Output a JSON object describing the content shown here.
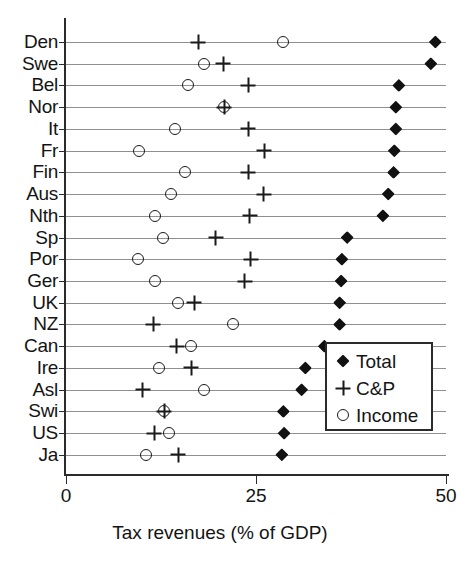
{
  "chart_data": {
    "type": "scatter",
    "title": "",
    "xlabel": "Tax revenues (% of GDP)",
    "ylabel": "",
    "xlim": [
      0,
      50
    ],
    "xticks": [
      0,
      25,
      50
    ],
    "xtick_labels": [
      "0",
      "25",
      "50"
    ],
    "grid": true,
    "legend_position": "lower-right",
    "categories": [
      "Den",
      "Swe",
      "Bel",
      "Nor",
      "It",
      "Fr",
      "Fin",
      "Aus",
      "Nth",
      "Sp",
      "Por",
      "Ger",
      "UK",
      "NZ",
      "Can",
      "Ire",
      "Asl",
      "Swi",
      "US",
      "Ja"
    ],
    "series": [
      {
        "name": "Total",
        "marker": "diamond",
        "values": [
          48.6,
          48.0,
          43.8,
          43.4,
          43.4,
          43.2,
          43.1,
          42.4,
          41.7,
          37.0,
          36.3,
          36.2,
          36.0,
          36.0,
          34.0,
          31.5,
          31.0,
          28.6,
          28.7,
          28.4
        ]
      },
      {
        "name": "C&P",
        "marker": "plus",
        "values": [
          17.4,
          20.7,
          24.0,
          20.8,
          24.0,
          26.1,
          24.0,
          26.0,
          24.2,
          19.7,
          24.3,
          23.5,
          16.9,
          11.5,
          14.6,
          16.5,
          10.1,
          12.9,
          11.6,
          14.8
        ]
      },
      {
        "name": "Income",
        "marker": "circle",
        "values": [
          28.6,
          18.1,
          16.0,
          20.8,
          14.3,
          9.6,
          15.7,
          13.8,
          11.7,
          12.8,
          9.5,
          11.7,
          14.8,
          22.0,
          16.5,
          12.3,
          18.1,
          12.9,
          13.5,
          10.5
        ]
      }
    ]
  },
  "legend": {
    "items": [
      {
        "label": "Total",
        "marker": "diamond-icon"
      },
      {
        "label": "C&P",
        "marker": "plus-icon"
      },
      {
        "label": "Income",
        "marker": "circle-icon"
      }
    ]
  },
  "colors": {
    "marker": "#111111",
    "axis": "#2b2b2b",
    "grid": "#8f8f8f",
    "background": "#ffffff"
  }
}
